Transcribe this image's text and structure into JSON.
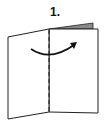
{
  "step": {
    "label": "1."
  },
  "diagram": {
    "colors": {
      "stroke": "#222222",
      "page_fill": "#ffffff",
      "back_page_fill": "#8a8a8a",
      "background": "#ffffff"
    },
    "elements": [
      {
        "name": "left-page",
        "type": "polygon"
      },
      {
        "name": "right-page",
        "type": "polygon"
      },
      {
        "name": "back-page-sliver",
        "type": "polygon"
      },
      {
        "name": "fold-line",
        "type": "dashed-line"
      },
      {
        "name": "fold-arrow",
        "type": "curved-arrow",
        "direction": "left-to-right"
      }
    ]
  }
}
